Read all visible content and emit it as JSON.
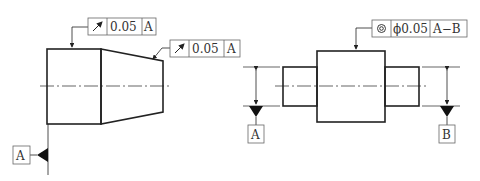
{
  "left_part": {
    "fcf_top": {
      "symbol": "circular-runout",
      "tolerance": "0.05",
      "datum": "A"
    },
    "fcf_cone": {
      "symbol": "circular-runout",
      "tolerance": "0.05",
      "datum": "A"
    },
    "datum_label": "A"
  },
  "right_part": {
    "fcf_top": {
      "symbol": "concentricity",
      "tolerance": "ϕ0.05",
      "datum": "A−B"
    },
    "datum_left_label": "A",
    "datum_right_label": "B"
  },
  "colors": {
    "line": "#222222",
    "background": "#ffffff",
    "frame": "#666666"
  }
}
